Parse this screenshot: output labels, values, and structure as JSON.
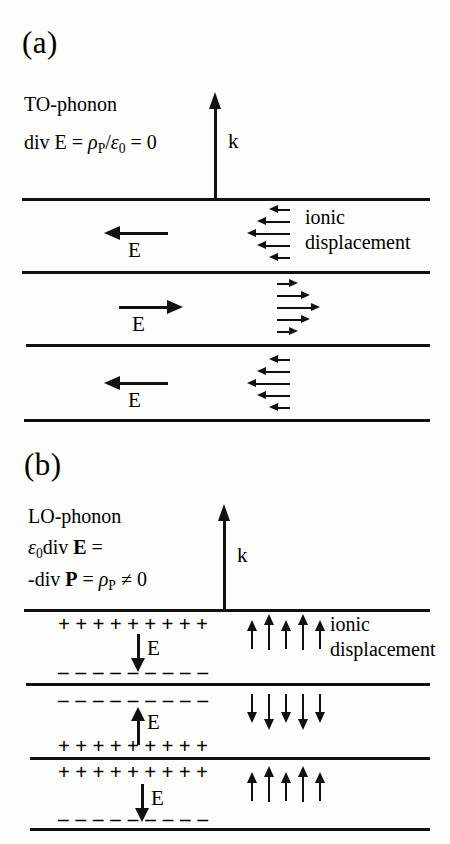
{
  "figure": {
    "type": "diagram"
  },
  "panel_a": {
    "label": "(a)",
    "title": "TO-phonon",
    "equation": {
      "lhs": "div E",
      "eq1": "=",
      "rho": "ρ",
      "rho_sub": "P",
      "slash": "/",
      "eps": "ε",
      "eps_sub": "0",
      "eq2": "=",
      "rhs": "0",
      "full_text": "div E = ρP/ε0 = 0"
    },
    "k_label": "k",
    "displacement_label_line1": "ionic",
    "displacement_label_line2": "displacement",
    "bands": [
      {
        "field_label": "E",
        "field_direction": "left",
        "displacement_direction": "left",
        "displacement_arrow_lengths": [
          14,
          26,
          36,
          26,
          14
        ]
      },
      {
        "field_label": "E",
        "field_direction": "right",
        "displacement_direction": "right",
        "displacement_arrow_lengths": [
          14,
          26,
          36,
          26,
          14
        ]
      },
      {
        "field_label": "E",
        "field_direction": "left",
        "displacement_direction": "left",
        "displacement_arrow_lengths": [
          14,
          26,
          36,
          26,
          14
        ]
      }
    ]
  },
  "panel_b": {
    "label": "(b)",
    "title": "LO-phonon",
    "equation_line1": {
      "eps": "ε",
      "eps_sub": "0",
      "text": "div",
      "bold_E": "E",
      "eq": "=",
      "full_text": "ε0 div E ="
    },
    "equation_line2": {
      "minus_div": "-div",
      "bold_P": "P",
      "eq": "=",
      "rho": "ρ",
      "rho_sub": "P",
      "neq": "≠",
      "zero": "0",
      "full_text": "-div P = ρP ≠ 0"
    },
    "k_label": "k",
    "displacement_label_line1": "ionic",
    "displacement_label_line2": "displacement",
    "charge_plus": "+",
    "charge_minus": "–",
    "charge_count": 9,
    "bands": [
      {
        "top_charges": "+",
        "bottom_charges": "–",
        "field_label": "E",
        "field_direction": "down",
        "displacement_direction": "up"
      },
      {
        "top_charges": "–",
        "bottom_charges": "+",
        "field_label": "E",
        "field_direction": "up",
        "displacement_direction": "down"
      },
      {
        "top_charges": "+",
        "bottom_charges": "–",
        "field_label": "E",
        "field_direction": "down",
        "displacement_direction": "up"
      }
    ]
  },
  "colors": {
    "ink": "#111111",
    "background": "#fdfdfc"
  }
}
